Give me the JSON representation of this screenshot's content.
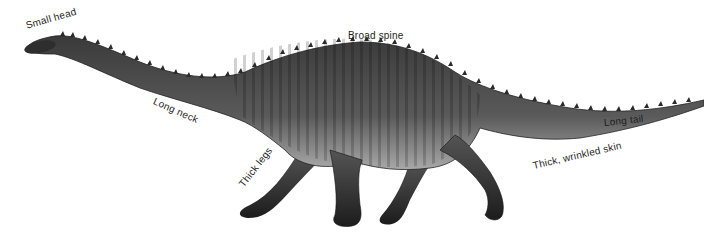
{
  "diagram": {
    "colors": {
      "body_dark": "#3a3a3a",
      "body_mid": "#6b6b6b",
      "belly_light": "#a9a9a9",
      "text": "#1e1e1e"
    },
    "labels": [
      {
        "id": "small-head",
        "text": "Small head"
      },
      {
        "id": "broad-spine",
        "text": "Broad spine"
      },
      {
        "id": "long-neck",
        "text": "Long neck"
      },
      {
        "id": "long-tail",
        "text": "Long tail"
      },
      {
        "id": "thick-legs",
        "text": "Thick legs"
      },
      {
        "id": "wrinkled-skin",
        "text": "Thick, wrinkled skin"
      }
    ]
  }
}
